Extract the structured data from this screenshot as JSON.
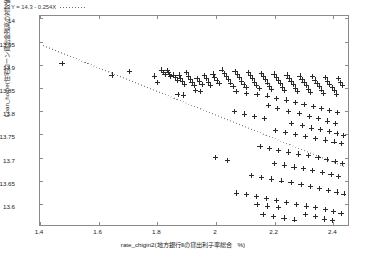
{
  "chart_data": {
    "type": "scatter",
    "title": "",
    "xlabel": "rate_chigin2(地方銀行Ⅱの貸出利子率総合　%)",
    "ylabel": "Loan_home(住宅ローン貸出金残高の対数値)",
    "xlim": [
      1.4,
      2.45
    ],
    "ylim": [
      13.555,
      14.005
    ],
    "xticks": [
      "1.4",
      "1.6",
      "1.8",
      "2",
      "2.2",
      "2.4"
    ],
    "xtick_values": [
      1.4,
      1.6,
      1.8,
      2.0,
      2.2,
      2.4
    ],
    "yticks": [
      "14",
      "13.95",
      "13.9",
      "13.85",
      "13.8",
      "13.75",
      "13.7",
      "13.65",
      "13.6"
    ],
    "ytick_values": [
      14,
      13.95,
      13.9,
      13.85,
      13.8,
      13.75,
      13.7,
      13.65,
      13.6
    ],
    "grid": false,
    "marker": "plus",
    "marker_color": "#2a2a2a",
    "frame_color": "#8a8a8a",
    "annotation": {
      "equation": "Y = 14.3 - 0.254X",
      "legend_style": "dotted-line"
    },
    "regression": {
      "intercept": 14.3,
      "slope": -0.254,
      "style": "dotted",
      "color": "#6a6a6a",
      "x_start": 1.41,
      "x_end": 2.44
    },
    "points": [
      [
        1.475,
        13.903
      ],
      [
        1.645,
        13.878
      ],
      [
        1.705,
        13.885
      ],
      [
        1.815,
        13.889
      ],
      [
        1.822,
        13.884
      ],
      [
        1.826,
        13.879
      ],
      [
        1.833,
        13.888
      ],
      [
        1.838,
        13.884
      ],
      [
        1.842,
        13.879
      ],
      [
        1.845,
        13.874
      ],
      [
        1.79,
        13.876
      ],
      [
        1.8,
        13.862
      ],
      [
        1.855,
        13.878
      ],
      [
        1.862,
        13.872
      ],
      [
        1.868,
        13.866
      ],
      [
        1.874,
        13.878
      ],
      [
        1.88,
        13.871
      ],
      [
        1.886,
        13.864
      ],
      [
        1.892,
        13.858
      ],
      [
        1.9,
        13.884
      ],
      [
        1.906,
        13.876
      ],
      [
        1.912,
        13.869
      ],
      [
        1.918,
        13.862
      ],
      [
        1.925,
        13.855
      ],
      [
        1.935,
        13.871
      ],
      [
        1.944,
        13.864
      ],
      [
        1.952,
        13.858
      ],
      [
        1.96,
        13.877
      ],
      [
        1.967,
        13.87
      ],
      [
        1.974,
        13.863
      ],
      [
        1.982,
        13.856
      ],
      [
        1.99,
        13.88
      ],
      [
        1.996,
        13.873
      ],
      [
        2.003,
        13.866
      ],
      [
        2.01,
        13.859
      ],
      [
        1.93,
        13.844
      ],
      [
        1.948,
        13.843
      ],
      [
        2.02,
        13.889
      ],
      [
        2.028,
        13.882
      ],
      [
        2.035,
        13.875
      ],
      [
        2.043,
        13.868
      ],
      [
        2.05,
        13.861
      ],
      [
        2.058,
        13.854
      ],
      [
        2.065,
        13.886
      ],
      [
        2.072,
        13.879
      ],
      [
        2.08,
        13.872
      ],
      [
        2.087,
        13.865
      ],
      [
        2.095,
        13.858
      ],
      [
        2.102,
        13.851
      ],
      [
        2.11,
        13.884
      ],
      [
        2.117,
        13.877
      ],
      [
        2.124,
        13.87
      ],
      [
        2.132,
        13.863
      ],
      [
        2.139,
        13.856
      ],
      [
        2.147,
        13.849
      ],
      [
        2.154,
        13.882
      ],
      [
        2.161,
        13.875
      ],
      [
        2.168,
        13.868
      ],
      [
        2.176,
        13.861
      ],
      [
        2.183,
        13.854
      ],
      [
        2.19,
        13.847
      ],
      [
        2.198,
        13.88
      ],
      [
        2.205,
        13.873
      ],
      [
        2.212,
        13.866
      ],
      [
        2.22,
        13.859
      ],
      [
        2.227,
        13.852
      ],
      [
        2.234,
        13.845
      ],
      [
        2.242,
        13.878
      ],
      [
        2.249,
        13.871
      ],
      [
        2.256,
        13.864
      ],
      [
        2.264,
        13.857
      ],
      [
        2.271,
        13.85
      ],
      [
        2.278,
        13.843
      ],
      [
        2.286,
        13.876
      ],
      [
        2.293,
        13.869
      ],
      [
        2.3,
        13.862
      ],
      [
        2.308,
        13.855
      ],
      [
        2.315,
        13.848
      ],
      [
        2.322,
        13.841
      ],
      [
        2.33,
        13.874
      ],
      [
        2.337,
        13.867
      ],
      [
        2.344,
        13.86
      ],
      [
        2.352,
        13.853
      ],
      [
        2.359,
        13.846
      ],
      [
        2.366,
        13.839
      ],
      [
        2.374,
        13.872
      ],
      [
        2.381,
        13.865
      ],
      [
        2.388,
        13.858
      ],
      [
        2.396,
        13.851
      ],
      [
        2.403,
        13.844
      ],
      [
        2.41,
        13.837
      ],
      [
        2.418,
        13.87
      ],
      [
        2.425,
        13.862
      ],
      [
        2.432,
        13.855
      ],
      [
        1.87,
        13.836
      ],
      [
        1.89,
        13.835
      ],
      [
        2.068,
        13.843
      ],
      [
        2.105,
        13.838
      ],
      [
        2.14,
        13.836
      ],
      [
        2.175,
        13.833
      ],
      [
        2.206,
        13.828
      ],
      [
        2.24,
        13.824
      ],
      [
        2.272,
        13.819
      ],
      [
        2.3,
        13.814
      ],
      [
        2.332,
        13.81
      ],
      [
        2.36,
        13.806
      ],
      [
        2.388,
        13.801
      ],
      [
        2.414,
        13.797
      ],
      [
        2.178,
        13.812
      ],
      [
        2.21,
        13.806
      ],
      [
        2.246,
        13.8
      ],
      [
        2.285,
        13.795
      ],
      [
        2.318,
        13.789
      ],
      [
        2.35,
        13.784
      ],
      [
        2.38,
        13.779
      ],
      [
        2.408,
        13.774
      ],
      [
        2.062,
        13.8
      ],
      [
        2.096,
        13.794
      ],
      [
        2.13,
        13.789
      ],
      [
        2.166,
        13.784
      ],
      [
        2.258,
        13.774
      ],
      [
        2.294,
        13.769
      ],
      [
        2.326,
        13.764
      ],
      [
        2.356,
        13.76
      ],
      [
        2.386,
        13.756
      ],
      [
        2.412,
        13.752
      ],
      [
        2.434,
        13.748
      ],
      [
        2.204,
        13.758
      ],
      [
        2.238,
        13.754
      ],
      [
        2.272,
        13.75
      ],
      [
        2.306,
        13.746
      ],
      [
        2.34,
        13.742
      ],
      [
        2.372,
        13.738
      ],
      [
        2.402,
        13.734
      ],
      [
        2.428,
        13.73
      ],
      [
        2.15,
        13.724
      ],
      [
        2.182,
        13.72
      ],
      [
        2.214,
        13.716
      ],
      [
        2.248,
        13.712
      ],
      [
        2.282,
        13.708
      ],
      [
        2.316,
        13.704
      ],
      [
        2.348,
        13.7
      ],
      [
        2.378,
        13.696
      ],
      [
        2.406,
        13.692
      ],
      [
        2.43,
        13.688
      ],
      [
        2.2,
        13.688
      ],
      [
        2.234,
        13.684
      ],
      [
        2.266,
        13.68
      ],
      [
        2.298,
        13.676
      ],
      [
        2.33,
        13.672
      ],
      [
        2.362,
        13.668
      ],
      [
        2.392,
        13.664
      ],
      [
        2.418,
        13.66
      ],
      [
        2.12,
        13.662
      ],
      [
        2.154,
        13.658
      ],
      [
        2.188,
        13.654
      ],
      [
        2.222,
        13.65
      ],
      [
        2.256,
        13.646
      ],
      [
        2.29,
        13.642
      ],
      [
        2.322,
        13.638
      ],
      [
        2.354,
        13.634
      ],
      [
        2.384,
        13.63
      ],
      [
        2.412,
        13.626
      ],
      [
        2.436,
        13.622
      ],
      [
        2.07,
        13.624
      ],
      [
        2.104,
        13.62
      ],
      [
        2.138,
        13.616
      ],
      [
        2.172,
        13.612
      ],
      [
        2.206,
        13.608
      ],
      [
        2.24,
        13.604
      ],
      [
        2.274,
        13.6
      ],
      [
        2.308,
        13.596
      ],
      [
        2.34,
        13.592
      ],
      [
        2.372,
        13.588
      ],
      [
        2.4,
        13.584
      ],
      [
        2.426,
        13.58
      ],
      [
        2.16,
        13.578
      ],
      [
        2.196,
        13.574
      ],
      [
        2.232,
        13.57
      ],
      [
        2.268,
        13.566
      ],
      [
        2.304,
        13.578
      ],
      [
        2.338,
        13.574
      ],
      [
        2.37,
        13.568
      ],
      [
        2.398,
        13.564
      ],
      [
        2.14,
        13.6
      ],
      [
        2.176,
        13.596
      ],
      [
        2.212,
        13.592
      ],
      [
        1.998,
        13.7
      ],
      [
        2.04,
        13.694
      ]
    ]
  }
}
